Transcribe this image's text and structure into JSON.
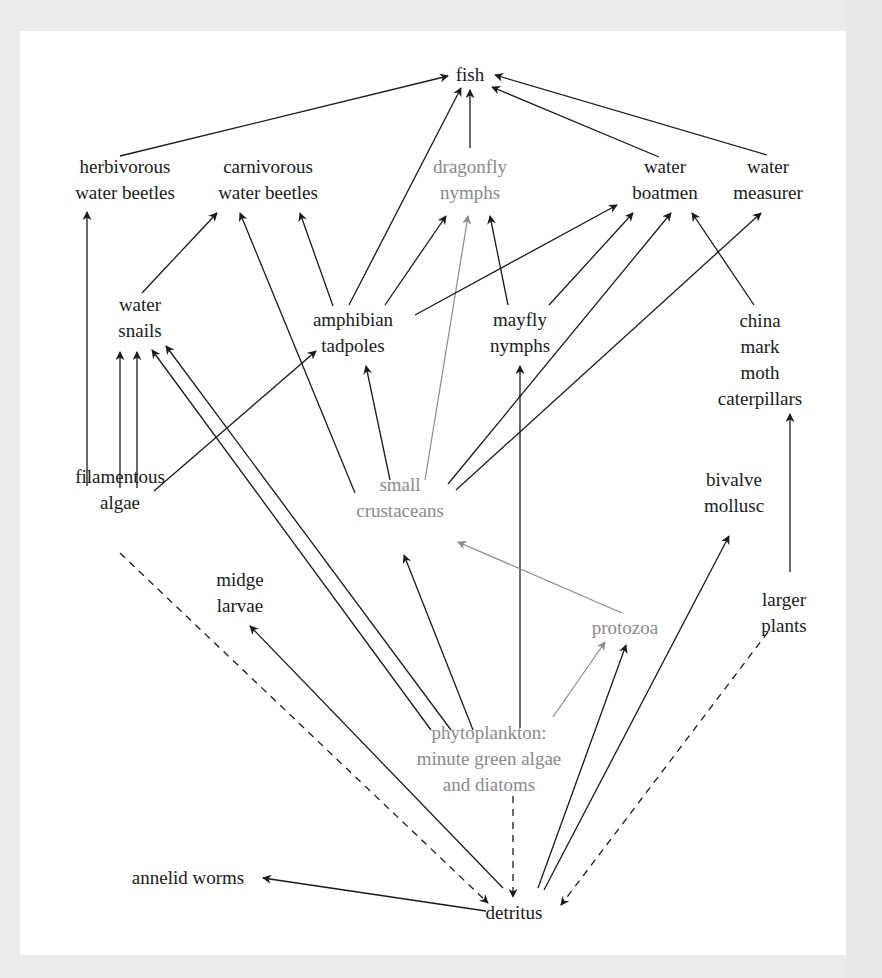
{
  "diagram": {
    "title": "",
    "type": "food-web",
    "colors": {
      "background": "#ececec",
      "panel": "#ffffff",
      "primary_text": "#1a1a1a",
      "highlight_text": "#8a8a8a",
      "edge_black": "#1a1a1a",
      "edge_gray": "#8a8a8a"
    },
    "nodes": [
      {
        "id": "fish",
        "lines": [
          "fish"
        ],
        "x": 470,
        "y": 75,
        "highlight": false
      },
      {
        "id": "herbivorous_water_beetles",
        "lines": [
          "herbivorous",
          "water beetles"
        ],
        "x": 125,
        "y": 180,
        "highlight": false
      },
      {
        "id": "carnivorous_water_beetles",
        "lines": [
          "carnivorous",
          "water beetles"
        ],
        "x": 268,
        "y": 180,
        "highlight": false
      },
      {
        "id": "dragonfly_nymphs",
        "lines": [
          "dragonfly",
          "nymphs"
        ],
        "x": 470,
        "y": 180,
        "highlight": true
      },
      {
        "id": "water_boatmen",
        "lines": [
          "water",
          "boatmen"
        ],
        "x": 665,
        "y": 180,
        "highlight": false
      },
      {
        "id": "water_measurer",
        "lines": [
          "water",
          "measurer"
        ],
        "x": 768,
        "y": 180,
        "highlight": false
      },
      {
        "id": "water_snails",
        "lines": [
          "water",
          "snails"
        ],
        "x": 140,
        "y": 318,
        "highlight": false
      },
      {
        "id": "amphibian_tadpoles",
        "lines": [
          "amphibian",
          "tadpoles"
        ],
        "x": 353,
        "y": 333,
        "highlight": false
      },
      {
        "id": "mayfly_nymphs",
        "lines": [
          "mayfly",
          "nymphs"
        ],
        "x": 520,
        "y": 333,
        "highlight": false
      },
      {
        "id": "china_mark_moth_caterpillars",
        "lines": [
          "china",
          "mark",
          "moth",
          "caterpillars"
        ],
        "x": 760,
        "y": 360,
        "highlight": false
      },
      {
        "id": "filamentous_algae",
        "lines": [
          "filamentous",
          "algae"
        ],
        "x": 120,
        "y": 490,
        "highlight": false
      },
      {
        "id": "small_crustaceans",
        "lines": [
          "small",
          "crustaceans"
        ],
        "x": 400,
        "y": 498,
        "highlight": true
      },
      {
        "id": "bivalve_mollusc",
        "lines": [
          "bivalve",
          "mollusc"
        ],
        "x": 734,
        "y": 493,
        "highlight": false
      },
      {
        "id": "midge_larvae",
        "lines": [
          "midge",
          "larvae"
        ],
        "x": 240,
        "y": 593,
        "highlight": false
      },
      {
        "id": "larger_plants",
        "lines": [
          "larger",
          "plants"
        ],
        "x": 784,
        "y": 613,
        "highlight": false
      },
      {
        "id": "protozoa",
        "lines": [
          "protozoa"
        ],
        "x": 625,
        "y": 628,
        "highlight": true
      },
      {
        "id": "phytoplankton",
        "lines": [
          "phytoplankton:",
          "minute green algae",
          "and diatoms"
        ],
        "x": 489,
        "y": 759,
        "highlight": true
      },
      {
        "id": "annelid_worms",
        "lines": [
          "annelid worms"
        ],
        "x": 188,
        "y": 878,
        "highlight": false
      },
      {
        "id": "detritus",
        "lines": [
          "detritus"
        ],
        "x": 514,
        "y": 913,
        "highlight": false
      }
    ],
    "edges": [
      {
        "from": "herbivorous_water_beetles",
        "to": "fish",
        "style": "solid",
        "color": "black",
        "x1": 120,
        "y1": 156,
        "x2": 448,
        "y2": 76
      },
      {
        "from": "amphibian_tadpoles",
        "to": "fish",
        "style": "solid",
        "color": "black",
        "x1": 349,
        "y1": 305,
        "x2": 461,
        "y2": 88
      },
      {
        "from": "dragonfly_nymphs",
        "to": "fish",
        "style": "solid",
        "color": "black",
        "x1": 470,
        "y1": 148,
        "x2": 470,
        "y2": 90
      },
      {
        "from": "water_boatmen",
        "to": "fish",
        "style": "solid",
        "color": "black",
        "x1": 659,
        "y1": 157,
        "x2": 492,
        "y2": 87
      },
      {
        "from": "water_measurer",
        "to": "fish",
        "style": "solid",
        "color": "black",
        "x1": 767,
        "y1": 155,
        "x2": 495,
        "y2": 75
      },
      {
        "from": "filamentous_algae",
        "to": "herbivorous_water_beetles",
        "style": "solid",
        "color": "black",
        "x1": 87,
        "y1": 486,
        "x2": 87,
        "y2": 212
      },
      {
        "from": "water_snails",
        "to": "carnivorous_water_beetles",
        "style": "solid",
        "color": "black",
        "x1": 142,
        "y1": 293,
        "x2": 217,
        "y2": 213
      },
      {
        "from": "small_crustaceans",
        "to": "carnivorous_water_beetles",
        "style": "solid",
        "color": "black",
        "x1": 355,
        "y1": 493,
        "x2": 240,
        "y2": 213
      },
      {
        "from": "amphibian_tadpoles",
        "to": "carnivorous_water_beetles",
        "style": "solid",
        "color": "black",
        "x1": 333,
        "y1": 306,
        "x2": 300,
        "y2": 213
      },
      {
        "from": "amphibian_tadpoles",
        "to": "dragonfly_nymphs",
        "style": "solid",
        "color": "black",
        "x1": 385,
        "y1": 305,
        "x2": 446,
        "y2": 216
      },
      {
        "from": "small_crustaceans",
        "to": "dragonfly_nymphs",
        "style": "solid",
        "color": "gray",
        "x1": 425,
        "y1": 480,
        "x2": 468,
        "y2": 216
      },
      {
        "from": "mayfly_nymphs",
        "to": "dragonfly_nymphs",
        "style": "solid",
        "color": "black",
        "x1": 508,
        "y1": 305,
        "x2": 490,
        "y2": 216
      },
      {
        "from": "amphibian_tadpoles",
        "to": "water_boatmen",
        "style": "solid",
        "color": "black",
        "x1": 415,
        "y1": 315,
        "x2": 617,
        "y2": 205
      },
      {
        "from": "mayfly_nymphs",
        "to": "water_boatmen",
        "style": "solid",
        "color": "black",
        "x1": 549,
        "y1": 305,
        "x2": 633,
        "y2": 213
      },
      {
        "from": "small_crustaceans",
        "to": "water_boatmen",
        "style": "solid",
        "color": "black",
        "x1": 448,
        "y1": 484,
        "x2": 671,
        "y2": 213
      },
      {
        "from": "china_mark_moth_caterpillars",
        "to": "water_boatmen",
        "style": "solid",
        "color": "black",
        "x1": 754,
        "y1": 305,
        "x2": 692,
        "y2": 213
      },
      {
        "from": "small_crustaceans",
        "to": "water_measurer",
        "style": "solid",
        "color": "black",
        "x1": 456,
        "y1": 490,
        "x2": 761,
        "y2": 213
      },
      {
        "from": "filamentous_algae",
        "to": "water_snails",
        "style": "solid",
        "color": "black",
        "x1": 120,
        "y1": 488,
        "x2": 120,
        "y2": 352
      },
      {
        "from": "filamentous_algae",
        "to": "water_snails",
        "style": "solid",
        "color": "black",
        "x1": 137,
        "y1": 488,
        "x2": 137,
        "y2": 352
      },
      {
        "from": "phytoplankton",
        "to": "water_snails",
        "style": "solid",
        "color": "black",
        "x1": 431,
        "y1": 730,
        "x2": 152,
        "y2": 350
      },
      {
        "from": "phytoplankton",
        "to": "water_snails",
        "style": "solid",
        "color": "black",
        "x1": 451,
        "y1": 730,
        "x2": 166,
        "y2": 346
      },
      {
        "from": "filamentous_algae",
        "to": "amphibian_tadpoles",
        "style": "solid",
        "color": "black",
        "x1": 154,
        "y1": 491,
        "x2": 316,
        "y2": 351
      },
      {
        "from": "small_crustaceans",
        "to": "amphibian_tadpoles",
        "style": "solid",
        "color": "black",
        "x1": 390,
        "y1": 480,
        "x2": 366,
        "y2": 366
      },
      {
        "from": "phytoplankton",
        "to": "mayfly_nymphs",
        "style": "solid",
        "color": "black",
        "x1": 520,
        "y1": 728,
        "x2": 520,
        "y2": 366
      },
      {
        "from": "larger_plants",
        "to": "china_mark_moth_caterpillars",
        "style": "solid",
        "color": "black",
        "x1": 790,
        "y1": 572,
        "x2": 790,
        "y2": 414
      },
      {
        "from": "phytoplankton",
        "to": "small_crustaceans",
        "style": "solid",
        "color": "black",
        "x1": 473,
        "y1": 730,
        "x2": 404,
        "y2": 555
      },
      {
        "from": "protozoa",
        "to": "small_crustaceans",
        "style": "solid",
        "color": "gray",
        "x1": 622,
        "y1": 613,
        "x2": 458,
        "y2": 542
      },
      {
        "from": "phytoplankton",
        "to": "protozoa",
        "style": "solid",
        "color": "gray",
        "x1": 553,
        "y1": 717,
        "x2": 605,
        "y2": 642
      },
      {
        "from": "detritus",
        "to": "protozoa",
        "style": "solid",
        "color": "black",
        "x1": 538,
        "y1": 888,
        "x2": 626,
        "y2": 645
      },
      {
        "from": "detritus",
        "to": "bivalve_mollusc",
        "style": "solid",
        "color": "black",
        "x1": 544,
        "y1": 890,
        "x2": 729,
        "y2": 536
      },
      {
        "from": "detritus",
        "to": "midge_larvae",
        "style": "solid",
        "color": "black",
        "x1": 503,
        "y1": 888,
        "x2": 250,
        "y2": 626
      },
      {
        "from": "detritus",
        "to": "annelid_worms",
        "style": "solid",
        "color": "black",
        "x1": 486,
        "y1": 911,
        "x2": 263,
        "y2": 878
      },
      {
        "from": "filamentous_algae",
        "to": "detritus",
        "style": "dashed",
        "color": "black",
        "x1": 120,
        "y1": 553,
        "x2": 488,
        "y2": 903
      },
      {
        "from": "phytoplankton",
        "to": "detritus",
        "style": "dashed",
        "color": "black",
        "x1": 513,
        "y1": 796,
        "x2": 513,
        "y2": 897
      },
      {
        "from": "larger_plants",
        "to": "detritus",
        "style": "dashed",
        "color": "black",
        "x1": 768,
        "y1": 632,
        "x2": 561,
        "y2": 905
      }
    ]
  }
}
